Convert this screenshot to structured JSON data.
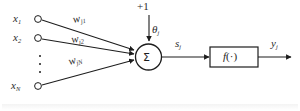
{
  "figure": {
    "kind": "artificial-neuron-diagram",
    "inputs": [
      {
        "label": "x",
        "subscript": "1"
      },
      {
        "label": "x",
        "subscript": "2"
      },
      {
        "label": "x",
        "subscript": "N"
      }
    ],
    "weights": [
      {
        "label": "w",
        "subscript": "j1"
      },
      {
        "label": "w",
        "subscript": "j2"
      },
      {
        "label": "w",
        "subscript": "jN"
      }
    ],
    "bias": {
      "value": "+1"
    },
    "threshold": {
      "label": "θ",
      "subscript": "j"
    },
    "summation": {
      "glyph": "Σ"
    },
    "net_input": {
      "label": "s",
      "subscript": "j"
    },
    "activation": {
      "name": "f",
      "argument": "(·)"
    },
    "output": {
      "label": "y",
      "subscript": "j"
    },
    "ellipsis": {
      "dots": 3
    },
    "colors": {
      "stroke": "#1d1d1d",
      "text": "#2b2b2b",
      "background": "#ffffff",
      "node_fill": "#ffffff"
    }
  }
}
